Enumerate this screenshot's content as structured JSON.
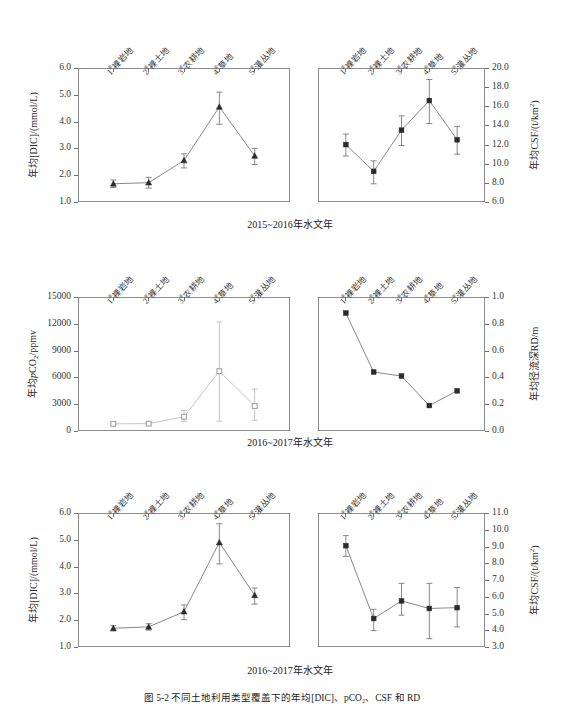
{
  "figure": {
    "caption": "图 5-2  不同土地利用类型覆盖下的年均[DIC]、pCO₂、CSF 和 RD",
    "categories": [
      "1#裸岩地",
      "2#裸土地",
      "3#农耕地",
      "4#草地",
      "5#灌丛地"
    ],
    "category_numbers": [
      "1",
      "2",
      "3",
      "4",
      "5"
    ],
    "category_names": [
      "裸岩地",
      "裸土地",
      "农耕地",
      "草地",
      "灌丛地"
    ],
    "hash_symbol": "#",
    "row_captions": {
      "row1": "2015~2016年水文年",
      "row2": "2016~2017年水文年",
      "row3": "2016~2017年水文年"
    },
    "colors": {
      "frame": "#8c8c8c",
      "line_dark": "#7a7a7a",
      "marker_dark": "#2b2b2b",
      "line_light": "#bdbdbd",
      "marker_light": "#9a9a9a",
      "text": "#2b2b2b"
    }
  },
  "chart_data": [
    {
      "id": "panel-dic-2015",
      "type": "line",
      "title": "",
      "xlabel": "",
      "ylabel": "年均[DIC]/(mmol/L)",
      "categories": [
        "1#裸岩地",
        "2#裸土地",
        "3#农耕地",
        "4#草地",
        "5#灌丛地"
      ],
      "values": [
        1.68,
        1.72,
        2.55,
        4.55,
        2.72
      ],
      "err_low": [
        0.14,
        0.2,
        0.28,
        0.65,
        0.32
      ],
      "err_high": [
        0.14,
        0.2,
        0.25,
        0.55,
        0.28
      ],
      "ylim": [
        1.0,
        6.0
      ],
      "yticks": [
        "1.0",
        "2.0",
        "3.0",
        "4.0",
        "5.0",
        "6.0"
      ],
      "marker": "triangle",
      "grid": false,
      "legend": "none",
      "y_axis_side": "left"
    },
    {
      "id": "panel-csf-2015",
      "type": "line",
      "title": "",
      "xlabel": "",
      "ylabel": "年均CSF/(t/km²)",
      "categories": [
        "1#裸岩地",
        "2#裸土地",
        "3#农耕地",
        "4#草地",
        "5#灌丛地"
      ],
      "values": [
        12.0,
        9.2,
        13.5,
        16.6,
        12.5
      ],
      "err_low": [
        1.2,
        1.3,
        1.6,
        2.4,
        1.5
      ],
      "err_high": [
        1.1,
        1.1,
        1.5,
        2.2,
        1.4
      ],
      "ylim": [
        6.0,
        20.0
      ],
      "yticks": [
        "6.0",
        "8.0",
        "10.0",
        "12.0",
        "14.0",
        "16.0",
        "18.0",
        "20.0"
      ],
      "marker": "square",
      "grid": false,
      "legend": "none",
      "y_axis_side": "right"
    },
    {
      "id": "panel-pco2-2016",
      "type": "line",
      "title": "",
      "xlabel": "",
      "ylabel": "年均pCO₂/ppmv",
      "categories": [
        "1#裸岩地",
        "2#裸土地",
        "3#农耕地",
        "4#草地",
        "5#灌丛地"
      ],
      "values": [
        800,
        820,
        1600,
        6700,
        2800
      ],
      "err_low": [
        120,
        130,
        500,
        5600,
        1600
      ],
      "err_high": [
        120,
        130,
        700,
        5500,
        1900
      ],
      "ylim": [
        0,
        15000
      ],
      "yticks": [
        "0",
        "3000",
        "6000",
        "9000",
        "12000",
        "15000"
      ],
      "marker": "open-square",
      "grid": false,
      "legend": "none",
      "y_axis_side": "left"
    },
    {
      "id": "panel-rd-2016",
      "type": "line",
      "title": "",
      "xlabel": "",
      "ylabel": "年均径流深RD/m",
      "categories": [
        "1#裸岩地",
        "2#裸土地",
        "3#农耕地",
        "4#草地",
        "5#灌丛地"
      ],
      "values": [
        0.88,
        0.44,
        0.41,
        0.19,
        0.3
      ],
      "err_low": [
        0,
        0,
        0,
        0,
        0
      ],
      "err_high": [
        0,
        0,
        0,
        0,
        0
      ],
      "ylim": [
        0.0,
        1.0
      ],
      "yticks": [
        "0.0",
        "0.2",
        "0.4",
        "0.6",
        "0.8",
        "1.0"
      ],
      "marker": "square",
      "grid": false,
      "legend": "none",
      "y_axis_side": "right"
    },
    {
      "id": "panel-dic-2016",
      "type": "line",
      "title": "",
      "xlabel": "",
      "ylabel": "年均[DIC]/(mmol/L)",
      "categories": [
        "1#裸岩地",
        "2#裸土地",
        "3#农耕地",
        "4#草地",
        "5#灌丛地"
      ],
      "values": [
        1.7,
        1.75,
        2.32,
        4.9,
        2.93
      ],
      "err_low": [
        0.1,
        0.12,
        0.3,
        0.8,
        0.33
      ],
      "err_high": [
        0.1,
        0.12,
        0.25,
        0.7,
        0.27
      ],
      "ylim": [
        1.0,
        6.0
      ],
      "yticks": [
        "1.0",
        "2.0",
        "3.0",
        "4.0",
        "5.0",
        "6.0"
      ],
      "marker": "triangle",
      "grid": false,
      "legend": "none",
      "y_axis_side": "left"
    },
    {
      "id": "panel-csf-2016",
      "type": "line",
      "title": "",
      "xlabel": "",
      "ylabel": "年均CSF/(t/km²)",
      "categories": [
        "1#裸岩地",
        "2#裸土地",
        "3#农耕地",
        "4#草地",
        "5#灌丛地"
      ],
      "values": [
        9.05,
        4.7,
        5.75,
        5.3,
        5.35
      ],
      "err_low": [
        0.65,
        0.72,
        0.85,
        1.8,
        1.15
      ],
      "err_high": [
        0.6,
        0.55,
        1.05,
        1.5,
        1.2
      ],
      "ylim": [
        3.0,
        11.0
      ],
      "yticks": [
        "3.0",
        "4.0",
        "5.0",
        "6.0",
        "7.0",
        "8.0",
        "9.0",
        "10.0",
        "11.0"
      ],
      "marker": "square",
      "grid": false,
      "legend": "none",
      "y_axis_side": "right"
    }
  ]
}
